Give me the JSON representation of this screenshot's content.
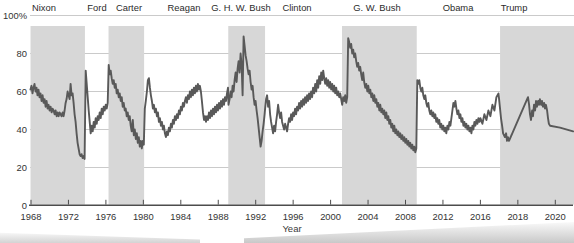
{
  "chart_data": {
    "type": "line",
    "title": "",
    "xlabel": "Year",
    "ylabel": "",
    "ylim": [
      0,
      100
    ],
    "grid": "horizontal",
    "legend": "none",
    "colors": {
      "band": "#d7d7d7",
      "line": "#595959",
      "axis": "#4d4d4d",
      "gridline": "#bcbcbc",
      "text": "#333333",
      "background": "#ffffff"
    },
    "y_ticks": [
      {
        "value": 100,
        "label": "100%"
      },
      {
        "value": 80,
        "label": "80"
      },
      {
        "value": 60,
        "label": "60"
      },
      {
        "value": 40,
        "label": "40"
      },
      {
        "value": 20,
        "label": "20"
      },
      {
        "value": 0,
        "label": "0"
      }
    ],
    "x_ticks": [
      {
        "year": 1968,
        "label": "1968"
      },
      {
        "year": 1972,
        "label": "1972"
      },
      {
        "year": 1976,
        "label": "1976"
      },
      {
        "year": 1980,
        "label": "1980"
      },
      {
        "year": 1984,
        "label": "1984"
      },
      {
        "year": 1988,
        "label": "1988"
      },
      {
        "year": 1992,
        "label": "1992"
      },
      {
        "year": 1996,
        "label": "1996"
      },
      {
        "year": 2000,
        "label": "2000"
      },
      {
        "year": 2004,
        "label": "2004"
      },
      {
        "year": 2008,
        "label": "2008"
      },
      {
        "year": 2012,
        "label": "2012"
      },
      {
        "year": 2016,
        "label": "2016"
      },
      {
        "year": 2018,
        "label": "2018"
      },
      {
        "year": 2020,
        "label": "2020"
      }
    ],
    "axis_note": "x spacing is 4 years per tick through 2016, 2 years per tick after 2016",
    "presidents": [
      {
        "name": "Nixon",
        "start": 1967.95,
        "end": 1973.76,
        "shaded": true,
        "label_x": 44
      },
      {
        "name": "Ford",
        "start": 1973.76,
        "end": 1976.28,
        "shaded": false,
        "label_x": 97
      },
      {
        "name": "Carter",
        "start": 1976.28,
        "end": 1980.08,
        "shaded": true,
        "label_x": 129
      },
      {
        "name": "Reagan",
        "start": 1980.08,
        "end": 1989.07,
        "shaded": false,
        "label_x": 184
      },
      {
        "name": "G. H. W. Bush",
        "start": 1989.07,
        "end": 1993.0,
        "shaded": true,
        "label_x": 241
      },
      {
        "name": "Clinton",
        "start": 1993.0,
        "end": 2001.22,
        "shaded": false,
        "label_x": 297
      },
      {
        "name": "G. W. Bush",
        "start": 2001.22,
        "end": 2009.2,
        "shaded": true,
        "label_x": 377
      },
      {
        "name": "Obama",
        "start": 2009.2,
        "end": 2017.05,
        "shaded": false,
        "label_x": 458
      },
      {
        "name": "Trump",
        "start": 2017.05,
        "end": 2021.3,
        "shaded": true,
        "label_x": 514
      }
    ],
    "series": {
      "name": "Presidential approval rating (%)",
      "eras": [
        {
          "president": "Nixon",
          "start_year": 1967.95,
          "step": 0.107,
          "values": [
            61,
            63,
            59,
            62,
            64,
            60,
            62,
            58,
            61,
            57,
            59,
            55,
            58,
            54,
            56,
            52,
            55,
            51,
            53,
            50,
            52,
            49,
            51,
            50,
            48,
            50,
            47,
            49,
            47,
            49,
            48,
            47,
            49,
            47,
            50,
            54,
            56,
            60,
            58,
            56,
            64,
            58,
            59,
            54,
            48,
            44,
            38,
            33,
            30,
            27,
            26,
            27,
            25,
            26,
            24.5
          ]
        },
        {
          "president": "Ford",
          "start_year": 1973.84,
          "step": 0.107,
          "values": [
            71,
            64,
            57,
            50,
            44,
            38,
            42,
            39,
            44,
            41,
            46,
            43,
            47,
            45,
            49,
            46,
            51,
            48,
            52,
            50,
            53,
            51,
            54
          ]
        },
        {
          "president": "Carter",
          "start_year": 1976.3,
          "step": 0.107,
          "values": [
            74,
            69,
            71,
            67,
            64,
            66,
            62,
            64,
            59,
            61,
            57,
            59,
            55,
            57,
            52,
            54,
            50,
            51,
            47,
            49,
            45,
            47,
            42,
            39,
            45,
            37,
            40,
            35,
            38,
            33,
            36,
            31,
            34,
            30,
            34,
            32
          ]
        },
        {
          "president": "Reagan",
          "start_year": 1980.16,
          "step": 0.107,
          "values": [
            51,
            55,
            60,
            66,
            67,
            62,
            58,
            55,
            51,
            53,
            49,
            51,
            47,
            49,
            44,
            46,
            42,
            44,
            40,
            42,
            38,
            36,
            39,
            37,
            41,
            39,
            43,
            41,
            45,
            43,
            47,
            45,
            48,
            46,
            50,
            48,
            52,
            50,
            54,
            52,
            55,
            57,
            54,
            58,
            56,
            60,
            57,
            61,
            58,
            62,
            59,
            63,
            60,
            64,
            61,
            63,
            60,
            55,
            49,
            45,
            47,
            44,
            47,
            45,
            49,
            46,
            50,
            47,
            51,
            48,
            52,
            49,
            53,
            50,
            54,
            51,
            55,
            52,
            56,
            53,
            57,
            55,
            59,
            62
          ]
        },
        {
          "president": "G. H. W. Bush",
          "start_year": 1989.1,
          "step": 0.107,
          "values": [
            53,
            56,
            60,
            57,
            63,
            60,
            66,
            70,
            65,
            72,
            76,
            70,
            80,
            74,
            58,
            89,
            84,
            79,
            76,
            72,
            69,
            71,
            65,
            61,
            63,
            57,
            53,
            55,
            50,
            46,
            41,
            36,
            31,
            34,
            39,
            43,
            48
          ]
        },
        {
          "president": "Clinton",
          "start_year": 1993.0,
          "step": 0.107,
          "values": [
            51,
            56,
            58,
            52,
            55,
            48,
            44,
            41,
            38,
            42,
            39,
            44,
            48,
            53,
            49,
            46,
            49,
            44,
            42,
            40,
            43,
            41,
            39,
            43,
            46,
            44,
            48,
            45,
            49,
            47,
            51,
            48,
            52,
            50,
            54,
            51,
            55,
            52,
            56,
            53,
            57,
            54,
            58,
            55,
            59,
            56,
            60,
            57,
            62,
            59,
            64,
            60,
            66,
            62,
            68,
            64,
            70,
            66,
            71,
            67,
            64,
            67,
            63,
            66,
            62,
            65,
            61,
            64,
            60,
            63,
            59,
            62,
            58,
            60,
            57,
            59,
            56
          ]
        },
        {
          "president": "G. W. Bush",
          "start_year": 2001.24,
          "step": 0.107,
          "values": [
            53,
            57,
            55,
            58,
            54,
            57,
            88,
            86,
            83,
            85,
            80,
            82,
            78,
            80,
            76,
            73,
            75,
            71,
            73,
            69,
            66,
            70,
            65,
            62,
            64,
            60,
            63,
            59,
            61,
            57,
            59,
            55,
            58,
            54,
            56,
            52,
            54,
            50,
            53,
            49,
            51,
            48,
            50,
            46,
            49,
            45,
            47,
            43,
            45,
            41,
            43,
            39,
            42,
            38,
            40,
            37,
            39,
            36,
            38,
            35,
            37,
            34,
            36,
            33,
            35,
            32,
            34,
            31,
            33,
            30,
            32,
            29,
            31,
            28,
            30
          ]
        },
        {
          "president": "Obama",
          "start_year": 2009.26,
          "step": 0.107,
          "values": [
            66,
            64,
            66,
            62,
            60,
            62,
            58,
            56,
            58,
            54,
            52,
            54,
            50,
            48,
            50,
            47,
            49,
            46,
            48,
            44,
            46,
            43,
            45,
            41,
            43,
            40,
            42,
            39,
            41,
            38,
            42,
            40,
            44,
            42,
            46,
            50,
            54,
            52,
            55,
            51,
            48,
            50,
            46,
            48,
            44,
            46,
            42,
            44,
            41,
            43,
            40,
            42,
            39,
            41,
            38,
            42,
            40,
            44,
            42,
            45,
            43,
            46,
            44,
            46,
            43,
            48,
            45,
            50,
            47,
            53,
            50,
            57,
            59
          ]
        },
        {
          "president": "Trump",
          "points": [
            [
              2017.1,
              46
            ],
            [
              2017.16,
              42
            ],
            [
              2017.21,
              38
            ],
            [
              2017.31,
              36
            ],
            [
              2017.37,
              38
            ],
            [
              2017.42,
              34
            ],
            [
              2017.47,
              36
            ],
            [
              2017.53,
              34
            ],
            [
              2018.54,
              57
            ],
            [
              2018.6,
              53
            ],
            [
              2018.65,
              48
            ],
            [
              2018.7,
              45
            ],
            [
              2018.76,
              50
            ],
            [
              2018.81,
              47
            ],
            [
              2018.86,
              53
            ],
            [
              2018.92,
              50
            ],
            [
              2018.97,
              55
            ],
            [
              2019.02,
              52
            ],
            [
              2019.08,
              55
            ],
            [
              2019.13,
              53
            ],
            [
              2019.18,
              56
            ],
            [
              2019.24,
              53
            ],
            [
              2019.29,
              55
            ],
            [
              2019.34,
              52
            ],
            [
              2019.4,
              54
            ],
            [
              2019.45,
              51
            ],
            [
              2019.5,
              53
            ],
            [
              2019.56,
              50
            ],
            [
              2019.61,
              46
            ],
            [
              2019.66,
              43
            ],
            [
              2019.72,
              42
            ],
            [
              2020.25,
              41
            ],
            [
              2020.95,
              39
            ]
          ]
        }
      ]
    }
  }
}
